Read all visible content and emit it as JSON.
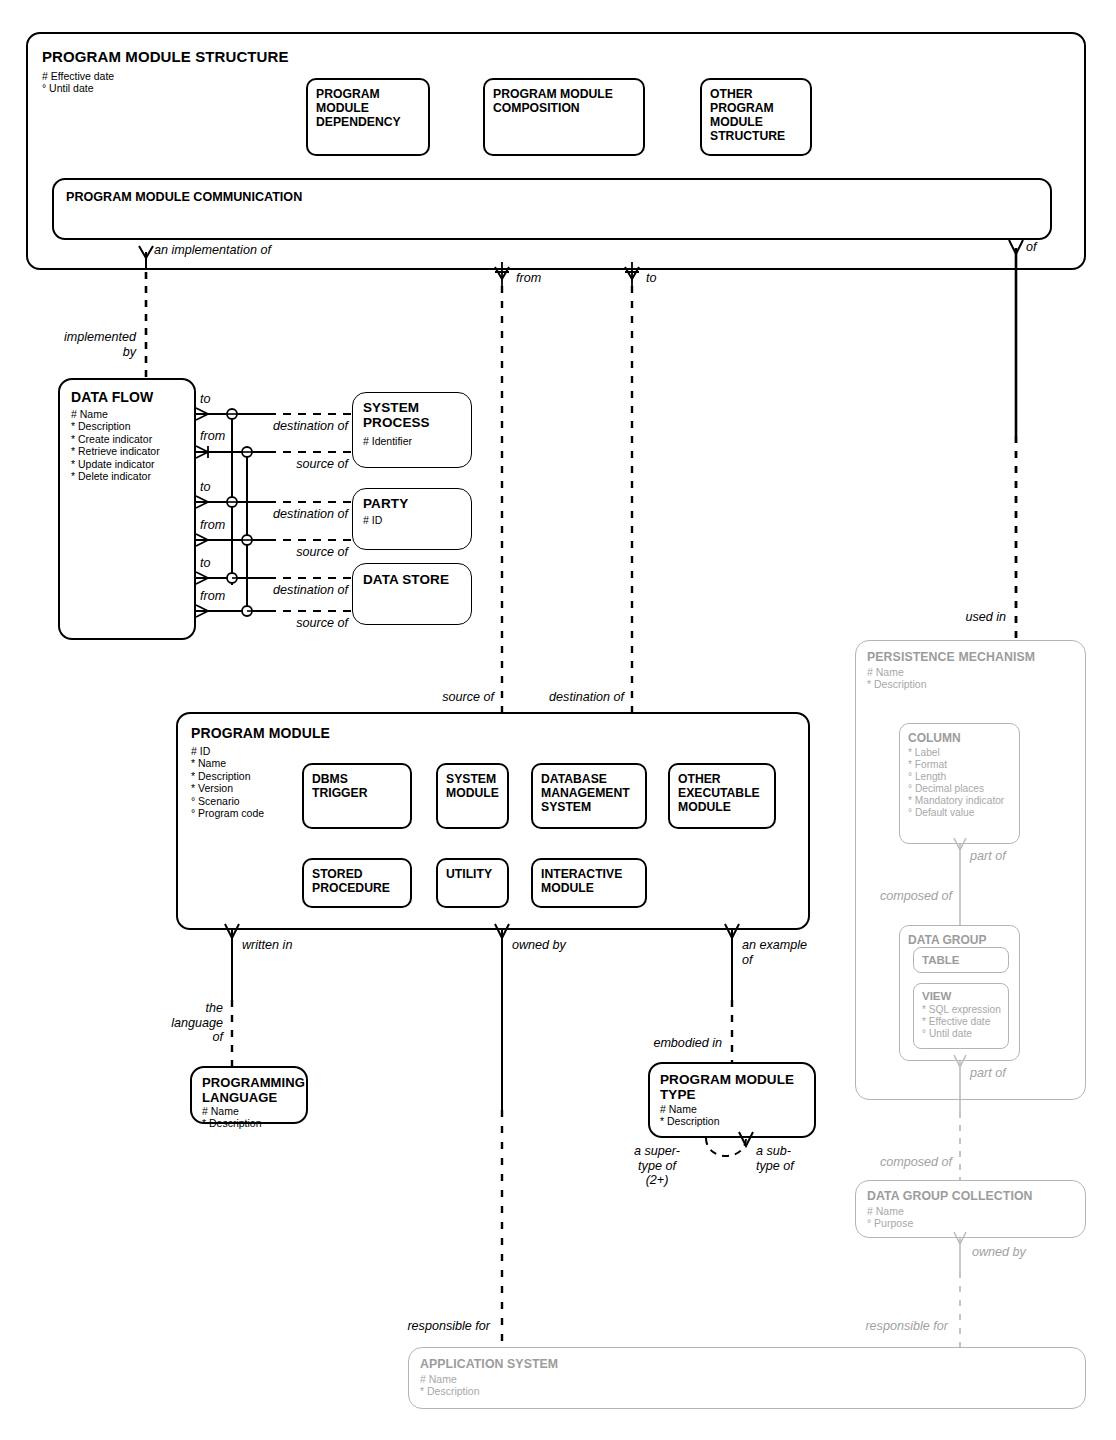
{
  "diagram": {
    "notation": "Barker / Oracle CASE entity-relationship",
    "colors": {
      "ink": "#000000",
      "greyed": "#a2a2a2",
      "paper": "#ffffff"
    }
  },
  "entities": {
    "program_module_structure": {
      "name": "PROGRAM MODULE STRUCTURE",
      "attributes": "# Effective date\n° Until date",
      "subtypes": [
        {
          "name": "PROGRAM\nMODULE\nDEPENDENCY"
        },
        {
          "name": "PROGRAM MODULE\nCOMPOSITION"
        },
        {
          "name": "OTHER\nPROGRAM\nMODULE\nSTRUCTURE"
        }
      ],
      "inner_entity": {
        "name": "PROGRAM MODULE COMMUNICATION"
      }
    },
    "data_flow": {
      "name": "DATA FLOW",
      "attributes": "# Name\n* Description\n* Create indicator\n* Retrieve indicator\n* Update indicator\n* Delete indicator"
    },
    "system_process": {
      "name": "SYSTEM\nPROCESS",
      "attributes": "# Identifier"
    },
    "party": {
      "name": "PARTY",
      "attributes": "# ID"
    },
    "data_store": {
      "name": "DATA STORE",
      "attributes": ""
    },
    "program_module": {
      "name": "PROGRAM MODULE",
      "attributes": "# ID\n* Name\n* Description\n* Version\n° Scenario\n° Program code",
      "subtypes": [
        {
          "name": "DBMS\nTRIGGER"
        },
        {
          "name": "SYSTEM\nMODULE"
        },
        {
          "name": "DATABASE\nMANAGEMENT\nSYSTEM"
        },
        {
          "name": "OTHER\nEXECUTABLE\nMODULE"
        },
        {
          "name": "STORED\nPROCEDURE"
        },
        {
          "name": "UTILITY"
        },
        {
          "name": "INTERACTIVE\nMODULE"
        }
      ]
    },
    "programming_language": {
      "name": "PROGRAMMING\nLANGUAGE",
      "attributes": "# Name\n* Description"
    },
    "program_module_type": {
      "name": "PROGRAM MODULE\nTYPE",
      "attributes": "# Name\n* Description"
    },
    "persistence_mechanism": {
      "name": "PERSISTENCE MECHANISM",
      "attributes": "# Name\n* Description",
      "greyed": true
    },
    "column": {
      "name": "COLUMN",
      "attributes": "* Label\n* Format\n° Length\n° Decimal places\n* Mandatory indicator\n° Default value",
      "greyed": true
    },
    "data_group": {
      "name": "DATA GROUP",
      "attributes": "",
      "greyed": true
    },
    "table": {
      "name": "TABLE",
      "attributes": "",
      "greyed": true
    },
    "view": {
      "name": "VIEW",
      "attributes": "* SQL expression\n* Effective date\n° Until date",
      "greyed": true
    },
    "data_group_collection": {
      "name": "DATA GROUP COLLECTION",
      "attributes": "# Name\n° Purpose",
      "greyed": true
    },
    "application_system": {
      "name": "APPLICATION SYSTEM",
      "attributes": "# Name\n* Description",
      "greyed": true
    }
  },
  "relationships": {
    "an_implementation_of": "an  implementation of",
    "implemented_by": "implemented\nby",
    "from_top": "from",
    "to_top": "to",
    "of": "of",
    "used_in": "used in",
    "to_1": "to",
    "from_1": "from",
    "to_2": "to",
    "from_2": "from",
    "to_3": "to",
    "from_3": "from",
    "destination_of_1": "destination of",
    "source_of_1": "source of",
    "destination_of_2": "destination of",
    "source_of_2": "source of",
    "destination_of_3": "destination of",
    "source_of_3": "source of",
    "source_of_pm": "source of",
    "destination_of_pm": "destination of",
    "written_in": "written in",
    "the_language_of": "the\nlanguage\nof",
    "owned_by": "owned by",
    "an_example_of": "an example\nof",
    "embodied_in": "embodied in",
    "a_supertype_of": "a super-\ntype of\n(2+)",
    "a_subtype_of": "a sub-\ntype of",
    "part_of_column": "part of",
    "composed_of_column": "composed of",
    "part_of_group": "part of",
    "composed_of_group": "composed of",
    "owned_by_dgc": "owned by",
    "responsible_for_left": "responsible for",
    "responsible_for_right": "responsible for"
  }
}
